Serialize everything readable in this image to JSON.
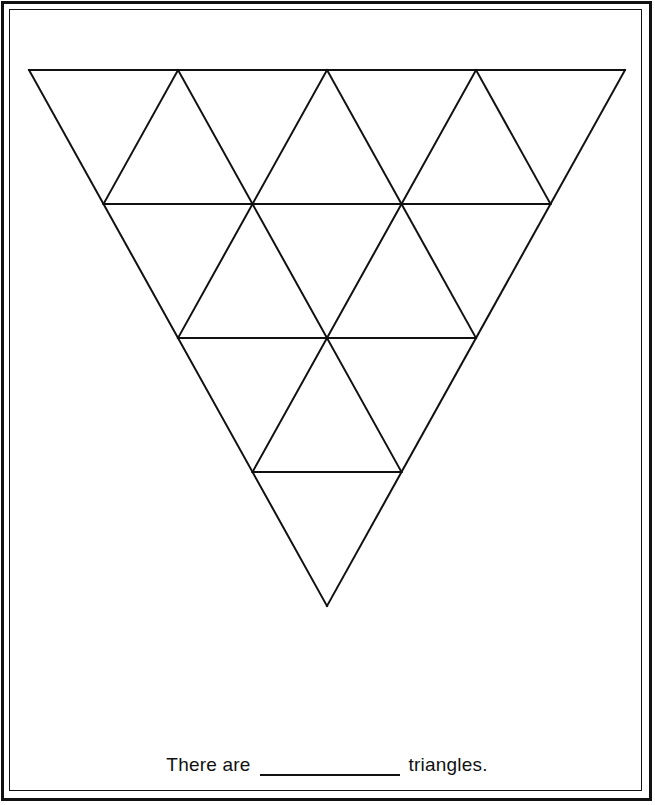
{
  "page": {
    "background_color": "#ffffff",
    "ink_color": "#111111",
    "width": 655,
    "height": 805
  },
  "frame": {
    "outer_name": "outer-border",
    "inner_name": "inner-border",
    "outer_thickness": 3,
    "inner_thickness": 1
  },
  "caption": {
    "lead_text": "There are",
    "trail_text": "triangles.",
    "answer_value": "",
    "blank_width_px": 140
  },
  "chart_data": {
    "type": "diagram",
    "title": "",
    "stroke_color": "#111111",
    "stroke_width": 2,
    "fill": "none",
    "orientation": "point-down",
    "rows": 4,
    "apex": {
      "x": 327,
      "y": 606
    },
    "top_left": {
      "x": 29,
      "y": 70
    },
    "top_right": {
      "x": 625,
      "y": 70
    },
    "cell_width": 149,
    "row_height": 134,
    "row_y": [
      70,
      204,
      338,
      472,
      606
    ],
    "row_x_start": [
      29,
      103.5,
      178,
      252.5,
      327
    ],
    "row_cells": [
      4,
      3,
      2,
      1
    ],
    "horizontal_segments": [
      {
        "x1": 29,
        "y1": 70,
        "x2": 625,
        "y2": 70
      },
      {
        "x1": 103.5,
        "y1": 204,
        "x2": 550.5,
        "y2": 204
      },
      {
        "x1": 178,
        "y1": 338,
        "x2": 476,
        "y2": 338
      },
      {
        "x1": 252.5,
        "y1": 472,
        "x2": 401.5,
        "y2": 472
      }
    ],
    "down_right_edges": [
      {
        "x1": 29,
        "y1": 70,
        "x2": 327,
        "y2": 606
      },
      {
        "x1": 178,
        "y1": 70,
        "x2": 327,
        "y2": 338
      },
      {
        "x1": 327,
        "y1": 70,
        "x2": 401.5,
        "y2": 204
      },
      {
        "x1": 476,
        "y1": 70,
        "x2": 476,
        "y2": 70
      }
    ],
    "down_left_edges": [
      {
        "x1": 625,
        "y1": 70,
        "x2": 327,
        "y2": 606
      },
      {
        "x1": 476,
        "y1": 70,
        "x2": 327,
        "y2": 338
      },
      {
        "x1": 327,
        "y1": 70,
        "x2": 252.5,
        "y2": 204
      }
    ],
    "total_small_triangles": 10,
    "upward_small_triangles": 6,
    "downward_small_triangles": 4
  }
}
